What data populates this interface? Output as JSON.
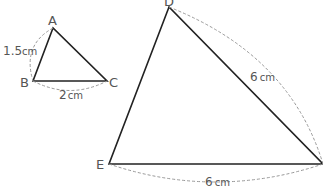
{
  "small_triangle": {
    "vertices": {
      "A": "A",
      "B": "B",
      "C": "C"
    },
    "side_AB": {
      "value": "1.5",
      "unit": "cm"
    },
    "side_BC": {
      "value": "2",
      "unit": "cm"
    }
  },
  "large_triangle": {
    "vertices": {
      "D": "D",
      "E": "E"
    },
    "side_DF": {
      "value": "6",
      "unit": "cm"
    },
    "side_EF": {
      "value": "6",
      "unit": "cm"
    }
  },
  "colors": {
    "line": "#222222",
    "dashed": "#999999",
    "text": "#555555"
  }
}
